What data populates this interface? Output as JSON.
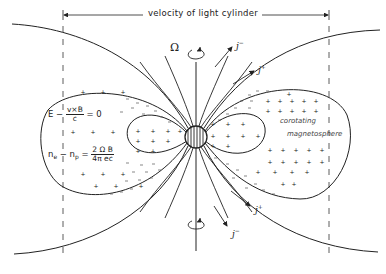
{
  "figure": {
    "title_label": "velocity of light cylinder",
    "rotation_symbol": "Ω",
    "current_labels": {
      "top_outer": {
        "base": "j",
        "sup": "−"
      },
      "top_inner": {
        "base": "j",
        "sup": "+"
      },
      "bottom_inner": {
        "base": "j",
        "sup": "+"
      },
      "bottom_outer": {
        "base": "j",
        "sup": "−"
      }
    },
    "equations": {
      "force_free": {
        "lhs": "E − ",
        "num": "v×B",
        "den": "c",
        "rhs": " = 0"
      },
      "charge_density": {
        "lhs": "n",
        "sub1": "e",
        "mid": " − n",
        "sub2": "p",
        "eq": " = ",
        "num": "2 Ω B",
        "den": "4π ec"
      }
    },
    "region_label": {
      "line1": "corotating",
      "line2": "magnetosphere"
    },
    "symbols": {
      "positive": "+",
      "negative": "−"
    },
    "colors": {
      "ink": "#222222",
      "background": "#ffffff"
    }
  }
}
